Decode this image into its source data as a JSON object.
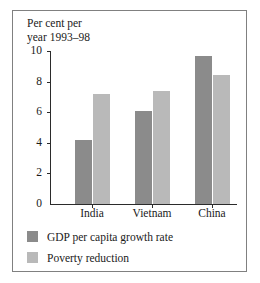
{
  "chart_data": {
    "type": "bar",
    "title": "Per cent per\nyear 1993–98",
    "xlabel": "",
    "ylabel": "Per cent per year 1993–98",
    "categories": [
      "India",
      "Vietnam",
      "China"
    ],
    "series": [
      {
        "name": "GDP per capita growth rate",
        "color": "#8b8b8b",
        "values": [
          4.2,
          6.1,
          9.7
        ]
      },
      {
        "name": "Poverty reduction",
        "color": "#b9b9b9",
        "values": [
          7.2,
          7.4,
          8.4
        ]
      }
    ],
    "ylim": [
      0,
      10
    ],
    "yticks": [
      0,
      2,
      4,
      6,
      8,
      10
    ],
    "ytick_labels": [
      "0",
      "2",
      "4",
      "6",
      "8",
      "10"
    ],
    "grid": false,
    "legend_position": "below-plot"
  },
  "legend": {
    "entries": [
      {
        "label": "GDP per capita growth rate",
        "color": "#8b8b8b"
      },
      {
        "label": "Poverty reduction",
        "color": "#b9b9b9"
      }
    ]
  },
  "frame": {
    "border_color": "#808080",
    "background": "#ffffff",
    "axis_color": "#2b2b2b"
  }
}
